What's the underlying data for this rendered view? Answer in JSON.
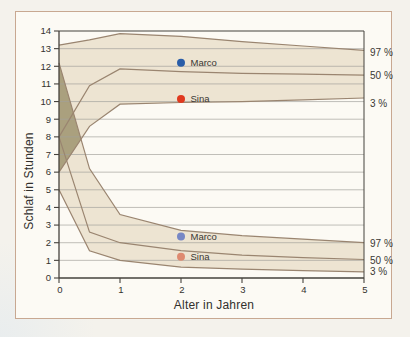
{
  "figure": {
    "background": "#f4f2ec",
    "frame_fill": "#fcfaf4",
    "frame_border": "#c8a891"
  },
  "chart_data": {
    "type": "area",
    "title": "",
    "xlabel": "Alter in Jahren",
    "ylabel": "Schlaf in Stunden",
    "xlim": [
      0,
      5
    ],
    "ylim": [
      0,
      14
    ],
    "x_ticks": [
      0,
      1,
      2,
      3,
      4,
      5
    ],
    "y_ticks": [
      0,
      1,
      2,
      3,
      4,
      5,
      6,
      7,
      8,
      9,
      10,
      11,
      12,
      13,
      14
    ],
    "grid": "horizontal",
    "grid_color": "#a3a29c",
    "axis_color": "#45423d",
    "line_color": "#9a8570",
    "overlap_fill": "#aaa07e",
    "x": [
      0,
      0.5,
      1,
      2,
      3,
      4,
      5
    ],
    "bands": [
      {
        "name": "upper-band",
        "fill": "#ede4d2",
        "series": [
          {
            "name": "97 %",
            "values": [
              13.2,
              13.5,
              13.85,
              13.7,
              13.4,
              13.15,
              12.9
            ]
          },
          {
            "name": "50 %",
            "values": [
              8.0,
              10.9,
              11.85,
              11.7,
              11.6,
              11.55,
              11.5
            ]
          },
          {
            "name": "3 %",
            "values": [
              6.0,
              8.6,
              9.85,
              9.95,
              10.0,
              10.1,
              10.2
            ]
          }
        ]
      },
      {
        "name": "lower-band",
        "fill": "#ede4d2",
        "series": [
          {
            "name": "97 %",
            "values": [
              12.2,
              6.2,
              3.6,
              2.7,
              2.4,
              2.2,
              2.0
            ]
          },
          {
            "name": "50 %",
            "values": [
              8.0,
              2.6,
              2.0,
              1.55,
              1.3,
              1.15,
              1.05
            ]
          },
          {
            "name": "3 %",
            "values": [
              5.0,
              1.55,
              1.0,
              0.62,
              0.5,
              0.42,
              0.35
            ]
          }
        ]
      }
    ],
    "right_labels": [
      {
        "text": "97 %",
        "y": 12.75
      },
      {
        "text": "50 %",
        "y": 11.45
      },
      {
        "text": "3 %",
        "y": 9.88
      },
      {
        "text": "97 %",
        "y": 1.95
      },
      {
        "text": "50 %",
        "y": 1.0
      },
      {
        "text": "3 %",
        "y": 0.35
      }
    ],
    "points": [
      {
        "label": "Marco",
        "x": 2,
        "y": 12.2,
        "color": "#2a5da8"
      },
      {
        "label": "Sina",
        "x": 2,
        "y": 10.15,
        "color": "#e0391f"
      },
      {
        "label": "Marco",
        "x": 2,
        "y": 2.35,
        "color": "#7787c5"
      },
      {
        "label": "Sina",
        "x": 2,
        "y": 1.2,
        "color": "#de8a70"
      }
    ],
    "text_color": "#34322e"
  }
}
